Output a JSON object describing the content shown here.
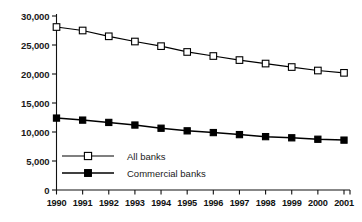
{
  "chart_data": {
    "type": "line",
    "title": "",
    "subtitle": "",
    "xlabel": "",
    "ylabel": "",
    "categories": [
      "1990",
      "1991",
      "1992",
      "1993",
      "1994",
      "1995",
      "1996",
      "1997",
      "1998",
      "1999",
      "2000",
      "2001"
    ],
    "series": [
      {
        "name": "All banks",
        "marker": "open-square",
        "color": "#000000",
        "values": [
          28100,
          27500,
          26500,
          25600,
          24800,
          23800,
          23100,
          22400,
          21800,
          21200,
          20600,
          20200
        ]
      },
      {
        "name": "Commercial banks",
        "marker": "filled-square",
        "color": "#000000",
        "values": [
          12400,
          12050,
          11650,
          11200,
          10650,
          10200,
          9900,
          9550,
          9200,
          9000,
          8750,
          8600
        ]
      }
    ],
    "ylim": [
      0,
      30000
    ],
    "yticks": [
      0,
      5000,
      10000,
      15000,
      20000,
      25000,
      30000
    ],
    "ytick_labels": [
      "0",
      "5,000",
      "10,000",
      "15,000",
      "20,000",
      "25,000",
      "30,000"
    ],
    "grid": false,
    "legend_position": "inside-lower-left"
  },
  "legend": {
    "entries": [
      {
        "label": "All banks",
        "marker": "open-square"
      },
      {
        "label": "Commercial banks",
        "marker": "filled-square"
      }
    ]
  }
}
